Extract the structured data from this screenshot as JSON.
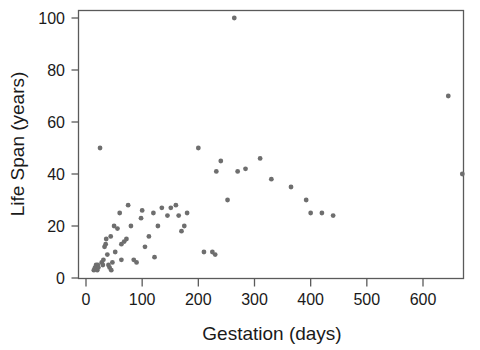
{
  "chart_data": {
    "type": "scatter",
    "title": "",
    "xlabel": "Gestation (days)",
    "ylabel": "Life Span (years)",
    "xlim": [
      0,
      672
    ],
    "ylim": [
      0,
      104
    ],
    "xticks": [
      0,
      100,
      200,
      300,
      400,
      500,
      600
    ],
    "yticks": [
      0,
      20,
      40,
      60,
      80,
      100
    ],
    "grid": false,
    "legend": null,
    "marker": {
      "shape": "circle",
      "color": "#6e6e6e",
      "size": 4
    },
    "point_count": 62,
    "x": [
      14,
      16,
      18,
      20,
      21,
      22,
      25,
      28,
      30,
      31,
      33,
      35,
      36,
      38,
      40,
      42,
      44,
      45,
      47,
      50,
      52,
      56,
      60,
      63,
      63,
      68,
      72,
      75,
      80,
      85,
      90,
      98,
      100,
      105,
      112,
      120,
      122,
      128,
      135,
      145,
      151,
      160,
      165,
      170,
      175,
      180,
      200,
      210,
      225,
      230,
      232,
      240,
      252,
      264,
      270,
      284,
      310,
      330,
      365,
      392,
      400,
      420,
      440,
      645,
      670
    ],
    "y": [
      3,
      4,
      5,
      3,
      5,
      4,
      50,
      6,
      5,
      7,
      12,
      13,
      15,
      9,
      5,
      4,
      16,
      3,
      6,
      20,
      10,
      19,
      25,
      13,
      7,
      14,
      15,
      28,
      20,
      7,
      6,
      23,
      26,
      12,
      16,
      25,
      8,
      20,
      27,
      24,
      27,
      28,
      24,
      18,
      20,
      25,
      50,
      10,
      10,
      9,
      41,
      45,
      30,
      100,
      41,
      42,
      46,
      38,
      35,
      30,
      25,
      25,
      24,
      70,
      40
    ],
    "points": [
      {
        "x": 14,
        "y": 3
      },
      {
        "x": 16,
        "y": 4
      },
      {
        "x": 18,
        "y": 5
      },
      {
        "x": 20,
        "y": 3
      },
      {
        "x": 21,
        "y": 5
      },
      {
        "x": 22,
        "y": 4
      },
      {
        "x": 25,
        "y": 50
      },
      {
        "x": 28,
        "y": 6
      },
      {
        "x": 30,
        "y": 5
      },
      {
        "x": 31,
        "y": 7
      },
      {
        "x": 33,
        "y": 12
      },
      {
        "x": 35,
        "y": 13
      },
      {
        "x": 36,
        "y": 15
      },
      {
        "x": 38,
        "y": 9
      },
      {
        "x": 40,
        "y": 5
      },
      {
        "x": 42,
        "y": 4
      },
      {
        "x": 44,
        "y": 16
      },
      {
        "x": 45,
        "y": 3
      },
      {
        "x": 47,
        "y": 6
      },
      {
        "x": 50,
        "y": 20
      },
      {
        "x": 52,
        "y": 10
      },
      {
        "x": 56,
        "y": 19
      },
      {
        "x": 60,
        "y": 25
      },
      {
        "x": 63,
        "y": 13
      },
      {
        "x": 63,
        "y": 7
      },
      {
        "x": 68,
        "y": 14
      },
      {
        "x": 72,
        "y": 15
      },
      {
        "x": 75,
        "y": 28
      },
      {
        "x": 80,
        "y": 20
      },
      {
        "x": 85,
        "y": 7
      },
      {
        "x": 90,
        "y": 6
      },
      {
        "x": 98,
        "y": 23
      },
      {
        "x": 100,
        "y": 26
      },
      {
        "x": 105,
        "y": 12
      },
      {
        "x": 112,
        "y": 16
      },
      {
        "x": 120,
        "y": 25
      },
      {
        "x": 122,
        "y": 8
      },
      {
        "x": 128,
        "y": 20
      },
      {
        "x": 135,
        "y": 27
      },
      {
        "x": 145,
        "y": 24
      },
      {
        "x": 151,
        "y": 27
      },
      {
        "x": 160,
        "y": 28
      },
      {
        "x": 165,
        "y": 24
      },
      {
        "x": 170,
        "y": 18
      },
      {
        "x": 175,
        "y": 20
      },
      {
        "x": 180,
        "y": 25
      },
      {
        "x": 200,
        "y": 50
      },
      {
        "x": 210,
        "y": 10
      },
      {
        "x": 225,
        "y": 10
      },
      {
        "x": 230,
        "y": 9
      },
      {
        "x": 232,
        "y": 41
      },
      {
        "x": 240,
        "y": 45
      },
      {
        "x": 252,
        "y": 30
      },
      {
        "x": 264,
        "y": 100
      },
      {
        "x": 270,
        "y": 41
      },
      {
        "x": 284,
        "y": 42
      },
      {
        "x": 310,
        "y": 46
      },
      {
        "x": 330,
        "y": 38
      },
      {
        "x": 365,
        "y": 35
      },
      {
        "x": 392,
        "y": 30
      },
      {
        "x": 400,
        "y": 25
      },
      {
        "x": 420,
        "y": 25
      },
      {
        "x": 440,
        "y": 24
      },
      {
        "x": 645,
        "y": 70
      },
      {
        "x": 670,
        "y": 40
      }
    ]
  }
}
